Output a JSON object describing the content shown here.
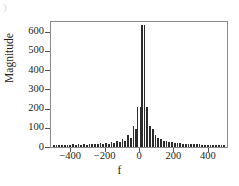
{
  "figure": {
    "crop_artifact_text": ")",
    "bar_color": "#2b2b2b",
    "frame_color": "#8a8a8a",
    "background_color": "#ffffff"
  },
  "chart_data": {
    "type": "bar",
    "title": "",
    "xlabel": "f",
    "ylabel": "Magnitude",
    "xlim": [
      -512,
      512
    ],
    "ylim": [
      0,
      650
    ],
    "grid": false,
    "legend": null,
    "yticks": [
      0,
      100,
      200,
      300,
      400,
      500,
      600
    ],
    "ytick_labels": [
      "0",
      "100",
      "200",
      "300",
      "400",
      "500",
      "600"
    ],
    "xticks": [
      -400,
      -200,
      0,
      200,
      400
    ],
    "xtick_labels": [
      "−400",
      "−200",
      "0",
      "200",
      "400"
    ],
    "x": [
      -496,
      -480,
      -464,
      -448,
      -432,
      -416,
      -400,
      -384,
      -368,
      -352,
      -336,
      -320,
      -304,
      -288,
      -272,
      -256,
      -240,
      -224,
      -208,
      -192,
      -176,
      -160,
      -144,
      -128,
      -112,
      -96,
      -80,
      -64,
      -48,
      -32,
      -16,
      -8,
      8,
      16,
      32,
      48,
      64,
      80,
      96,
      112,
      128,
      144,
      160,
      176,
      192,
      208,
      224,
      240,
      256,
      272,
      288,
      304,
      320,
      336,
      352,
      368,
      384,
      400,
      416,
      432,
      448,
      464,
      480,
      496
    ],
    "values": [
      11,
      13,
      11,
      13,
      11,
      13,
      12,
      14,
      12,
      14,
      13,
      15,
      13,
      16,
      14,
      17,
      15,
      19,
      16,
      22,
      18,
      26,
      21,
      32,
      25,
      42,
      32,
      60,
      48,
      110,
      95,
      210,
      210,
      635,
      635,
      210,
      110,
      95,
      60,
      48,
      42,
      32,
      32,
      26,
      25,
      22,
      21,
      19,
      18,
      17,
      16,
      15,
      15,
      14,
      14,
      13,
      13,
      12,
      13,
      11,
      13,
      11,
      13,
      11
    ]
  }
}
